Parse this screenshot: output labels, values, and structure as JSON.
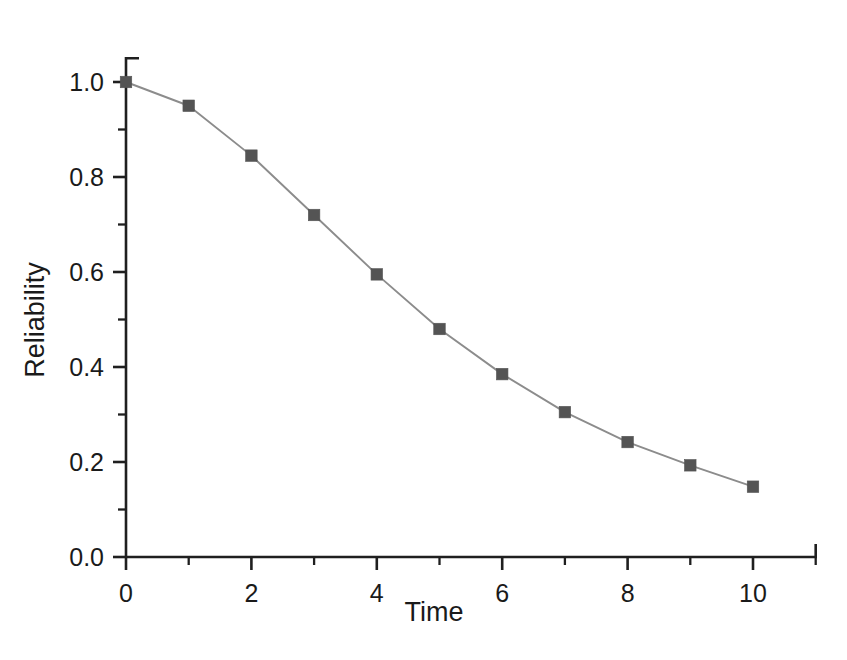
{
  "chart_data": {
    "type": "line",
    "title": "",
    "subtitle": "",
    "xlabel": "Time",
    "ylabel": "Reliability",
    "x": [
      0,
      1,
      2,
      3,
      4,
      5,
      6,
      7,
      8,
      9,
      10
    ],
    "values": [
      1.0,
      0.95,
      0.845,
      0.72,
      0.595,
      0.48,
      0.385,
      0.305,
      0.242,
      0.193,
      0.148
    ],
    "series": [
      {
        "name": "Reliability",
        "values": [
          1.0,
          0.95,
          0.845,
          0.72,
          0.595,
          0.48,
          0.385,
          0.305,
          0.242,
          0.193,
          0.148
        ]
      }
    ],
    "xlim": [
      0,
      11
    ],
    "ylim": [
      0.0,
      1.05
    ],
    "x_ticks": [
      0,
      2,
      4,
      6,
      8,
      10
    ],
    "x_tick_labels": [
      "0",
      "2",
      "4",
      "6",
      "8",
      "10"
    ],
    "x_minor_ticks": [
      1,
      3,
      5,
      7,
      9,
      11
    ],
    "y_ticks": [
      0.0,
      0.2,
      0.4,
      0.6,
      0.8,
      1.0
    ],
    "y_tick_labels": [
      "0.0",
      "0.2",
      "0.4",
      "0.6",
      "0.8",
      "1.0"
    ],
    "y_minor_ticks": [
      0.1,
      0.3,
      0.5,
      0.7,
      0.9
    ],
    "grid": false,
    "legend": false,
    "legend_position": "none",
    "marker": "square",
    "marker_color": "#545454",
    "line_color": "#8c8c8c",
    "axis_color": "#1f1f1f",
    "background_color": "#ffffff"
  }
}
